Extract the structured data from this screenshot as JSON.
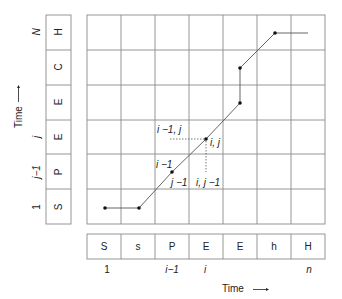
{
  "diagram": {
    "type": "dynamic-programming alignment grid",
    "grid": {
      "columns": 7,
      "rows": 6
    },
    "vertical_sequence": {
      "label": "Time",
      "cells_bottom_to_top": [
        "S",
        "P",
        "E",
        "E",
        "C",
        "H"
      ],
      "index_labels": [
        {
          "text": "1",
          "row": 0
        },
        {
          "text": "j−1",
          "row": 1
        },
        {
          "text": "j",
          "row": 2
        },
        {
          "text": "N",
          "row": 5
        }
      ]
    },
    "horizontal_sequence": {
      "label": "Time",
      "cells": [
        "S",
        "s",
        "P",
        "E",
        "E",
        "h",
        "H"
      ],
      "index_labels": [
        {
          "text": "1",
          "col": 0
        },
        {
          "text": "i−1",
          "col": 2
        },
        {
          "text": "i",
          "col": 3
        },
        {
          "text": "n",
          "col": 6
        }
      ]
    },
    "path_points": [
      {
        "col": 0,
        "row": 0
      },
      {
        "col": 1,
        "row": 0
      },
      {
        "col": 2,
        "row": 1
      },
      {
        "col": 3,
        "row": 2
      },
      {
        "col": 4,
        "row": 3
      },
      {
        "col": 4,
        "row": 4
      },
      {
        "col": 5,
        "row": 5
      }
    ],
    "annotations": {
      "i_minus_1_j": "i −1, j",
      "i_j": "i, j",
      "i_minus_1": "i −1",
      "j_minus_1": "j −1",
      "i_j_minus_1": "i, j −1"
    },
    "arrow": "——▸"
  }
}
